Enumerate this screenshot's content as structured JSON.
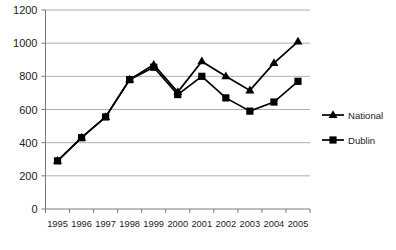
{
  "chart_data": {
    "type": "line",
    "title": "",
    "subtitle": "",
    "xlabel": "",
    "ylabel": "",
    "categories": [
      "1995",
      "1996",
      "1997",
      "1998",
      "1999",
      "2000",
      "2001",
      "2002",
      "2003",
      "2004",
      "2005"
    ],
    "ylim": [
      0,
      1200
    ],
    "ytick_labels": [
      "0",
      "200",
      "400",
      "600",
      "800",
      "1000",
      "1200"
    ],
    "ytick_values": [
      0,
      200,
      400,
      600,
      800,
      1000,
      1200
    ],
    "grid": true,
    "legend_position": "right",
    "series": [
      {
        "name": "National",
        "marker": "triangle",
        "color": "#000000",
        "values": [
          290,
          430,
          555,
          780,
          870,
          705,
          890,
          800,
          715,
          880,
          1010
        ]
      },
      {
        "name": "Dublin",
        "marker": "square",
        "color": "#000000",
        "values": [
          290,
          430,
          555,
          780,
          855,
          690,
          800,
          670,
          590,
          645,
          770
        ]
      }
    ]
  },
  "legend": {
    "entries": [
      {
        "label": "National",
        "marker": "triangle"
      },
      {
        "label": "Dublin",
        "marker": "square"
      }
    ]
  },
  "caption": {
    "text": ""
  }
}
